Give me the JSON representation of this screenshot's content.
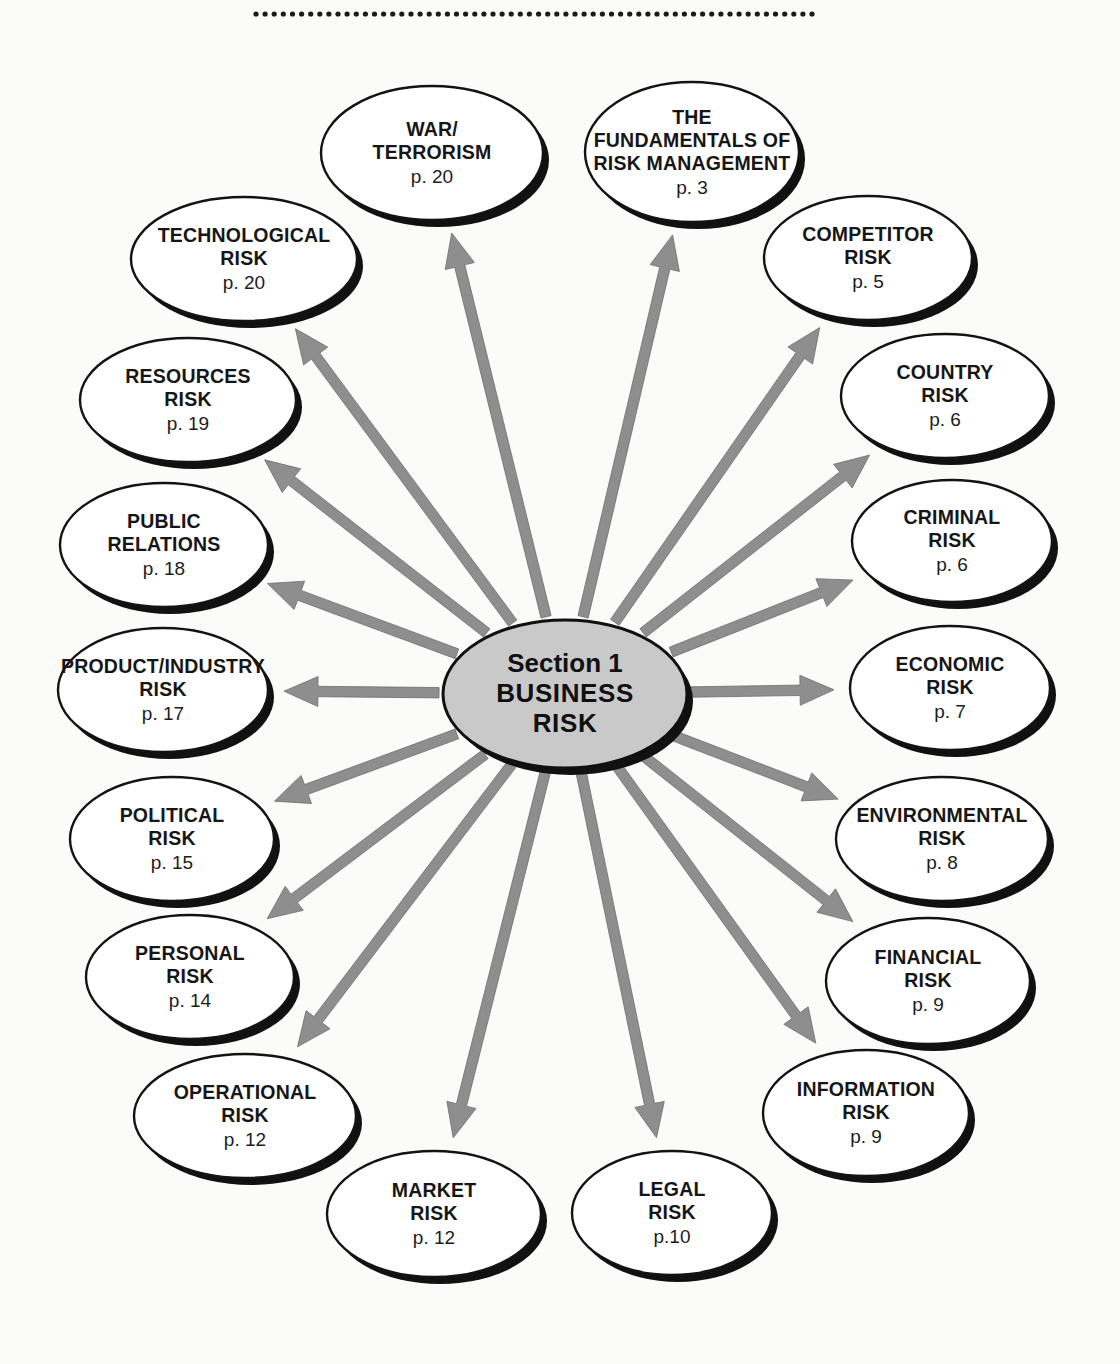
{
  "page": {
    "background_color": "#fbfbf9",
    "divider": {
      "name": "dotted-rule",
      "dots": 62,
      "color": "#1a1a1a"
    }
  },
  "hub": {
    "line1": "Section 1",
    "line2": "BUSINESS",
    "line3": "RISK",
    "fill_color": "#c9c9c9",
    "stroke_color": "#101010",
    "cx": 565,
    "cy": 694,
    "rx": 122,
    "ry": 74
  },
  "arrows": {
    "fill_color": "#8e8e8e",
    "stroke_color": "#6f6f6f",
    "count": 18,
    "style": "barbed-single-headed-outward"
  },
  "nodes": [
    {
      "id": "fundamentals-of-risk-management",
      "lines": [
        "THE",
        "FUNDAMENTALS OF",
        "RISK MANAGEMENT"
      ],
      "page": "p. 3",
      "cx": 692,
      "cy": 152,
      "rx": 107,
      "ry": 70
    },
    {
      "id": "competitor-risk",
      "lines": [
        "COMPETITOR",
        "RISK"
      ],
      "page": "p. 5",
      "cx": 868,
      "cy": 258,
      "rx": 104,
      "ry": 62
    },
    {
      "id": "country-risk",
      "lines": [
        "COUNTRY",
        "RISK"
      ],
      "page": "p. 6",
      "cx": 945,
      "cy": 396,
      "rx": 104,
      "ry": 62
    },
    {
      "id": "criminal-risk",
      "lines": [
        "CRIMINAL",
        "RISK"
      ],
      "page": "p. 6",
      "cx": 952,
      "cy": 541,
      "rx": 100,
      "ry": 61
    },
    {
      "id": "economic-risk",
      "lines": [
        "ECONOMIC",
        "RISK"
      ],
      "page": "p. 7",
      "cx": 950,
      "cy": 688,
      "rx": 100,
      "ry": 62
    },
    {
      "id": "environmental-risk",
      "lines": [
        "ENVIRONMENTAL",
        "RISK"
      ],
      "page": "p. 8",
      "cx": 942,
      "cy": 839,
      "rx": 106,
      "ry": 62
    },
    {
      "id": "financial-risk",
      "lines": [
        "FINANCIAL",
        "RISK"
      ],
      "page": "p. 9",
      "cx": 928,
      "cy": 981,
      "rx": 102,
      "ry": 63
    },
    {
      "id": "information-risk",
      "lines": [
        "INFORMATION",
        "RISK"
      ],
      "page": "p. 9",
      "cx": 866,
      "cy": 1113,
      "rx": 103,
      "ry": 63
    },
    {
      "id": "legal-risk",
      "lines": [
        "LEGAL",
        "RISK"
      ],
      "page": "p.10",
      "cx": 672,
      "cy": 1213,
      "rx": 100,
      "ry": 62
    },
    {
      "id": "market-risk",
      "lines": [
        "MARKET",
        "RISK"
      ],
      "page": "p. 12",
      "cx": 434,
      "cy": 1214,
      "rx": 107,
      "ry": 63
    },
    {
      "id": "operational-risk",
      "lines": [
        "OPERATIONAL",
        "RISK"
      ],
      "page": "p. 12",
      "cx": 245,
      "cy": 1116,
      "rx": 111,
      "ry": 62
    },
    {
      "id": "personal-risk",
      "lines": [
        "PERSONAL",
        "RISK"
      ],
      "page": "p. 14",
      "cx": 190,
      "cy": 977,
      "rx": 104,
      "ry": 62
    },
    {
      "id": "political-risk",
      "lines": [
        "POLITICAL",
        "RISK"
      ],
      "page": "p. 15",
      "cx": 172,
      "cy": 839,
      "rx": 102,
      "ry": 62
    },
    {
      "id": "product-industry-risk",
      "lines": [
        "PRODUCT/INDUSTRY",
        "RISK"
      ],
      "page": "p. 17",
      "cx": 163,
      "cy": 690,
      "rx": 105,
      "ry": 62
    },
    {
      "id": "public-relations",
      "lines": [
        "PUBLIC",
        "RELATIONS"
      ],
      "page": "p. 18",
      "cx": 164,
      "cy": 545,
      "rx": 104,
      "ry": 62
    },
    {
      "id": "resources-risk",
      "lines": [
        "RESOURCES",
        "RISK"
      ],
      "page": "p. 19",
      "cx": 188,
      "cy": 400,
      "rx": 108,
      "ry": 62
    },
    {
      "id": "technological-risk",
      "lines": [
        "TECHNOLOGICAL",
        "RISK"
      ],
      "page": "p. 20",
      "cx": 244,
      "cy": 259,
      "rx": 113,
      "ry": 62
    },
    {
      "id": "war-terrorism",
      "lines": [
        "WAR/",
        "TERRORISM"
      ],
      "page": "p. 20",
      "cx": 432,
      "cy": 153,
      "rx": 111,
      "ry": 67
    }
  ],
  "chart_data": {
    "type": "diagram",
    "layout": "radial hub-and-spoke (sunburst) with 18 outward arrows",
    "center": "Section 1 BUSINESS RISK",
    "spokes": [
      {
        "label": "THE FUNDAMENTALS OF RISK MANAGEMENT",
        "page": 3
      },
      {
        "label": "COMPETITOR RISK",
        "page": 5
      },
      {
        "label": "COUNTRY RISK",
        "page": 6
      },
      {
        "label": "CRIMINAL RISK",
        "page": 6
      },
      {
        "label": "ECONOMIC RISK",
        "page": 7
      },
      {
        "label": "ENVIRONMENTAL RISK",
        "page": 8
      },
      {
        "label": "FINANCIAL RISK",
        "page": 9
      },
      {
        "label": "INFORMATION RISK",
        "page": 9
      },
      {
        "label": "LEGAL RISK",
        "page": 10
      },
      {
        "label": "MARKET RISK",
        "page": 12
      },
      {
        "label": "OPERATIONAL RISK",
        "page": 12
      },
      {
        "label": "PERSONAL RISK",
        "page": 14
      },
      {
        "label": "POLITICAL RISK",
        "page": 15
      },
      {
        "label": "PRODUCT/INDUSTRY RISK",
        "page": 17
      },
      {
        "label": "PUBLIC RELATIONS",
        "page": 18
      },
      {
        "label": "RESOURCES RISK",
        "page": 19
      },
      {
        "label": "TECHNOLOGICAL RISK",
        "page": 20
      },
      {
        "label": "WAR/TERRORISM",
        "page": 20
      }
    ]
  }
}
